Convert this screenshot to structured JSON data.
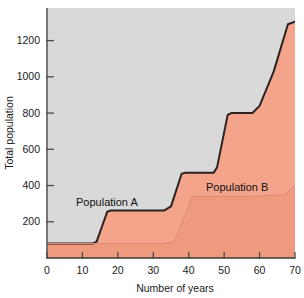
{
  "chart_data": {
    "type": "area",
    "title": "",
    "subtitle": "",
    "xlabel": "Number of years",
    "ylabel": "Total population",
    "xlim": [
      0,
      70
    ],
    "ylim": [
      0,
      1380
    ],
    "grid": false,
    "legend_position": "inline-annotations",
    "xticks": [
      0,
      10,
      20,
      30,
      40,
      50,
      60,
      70
    ],
    "xtick_labels": [
      "0",
      "10",
      "20",
      "30",
      "40",
      "50",
      "60",
      "70"
    ],
    "yticks": [
      200,
      400,
      600,
      800,
      1000,
      1200
    ],
    "ytick_labels": [
      "200",
      "400",
      "600",
      "800",
      "1000",
      "1200"
    ],
    "annotations": [
      {
        "text": "Population A",
        "x": 18,
        "y": 370
      },
      {
        "text": "Population B",
        "x": 48,
        "y": 460
      }
    ],
    "colors": {
      "plot_background": "#d9d9d9",
      "population_a_fill": "#f4a48a",
      "population_b_fill": "#ef9a7e",
      "total_outline": "#2b2320",
      "axis": "#5a5a5a",
      "text": "#1a1a1a"
    },
    "series": [
      {
        "name": "Population B",
        "description": "Lower stacked band, stepped growth",
        "x": [
          0,
          14,
          17,
          33,
          36,
          41,
          58,
          62,
          67,
          70
        ],
        "values": [
          80,
          80,
          80,
          80,
          90,
          340,
          340,
          345,
          350,
          400
        ]
      },
      {
        "name": "Total (Population A + Population B)",
        "description": "Upper boundary curve, stepped S-shaped growth",
        "x": [
          0,
          13,
          14,
          17,
          18,
          33,
          35,
          38,
          39,
          47,
          48,
          51,
          52,
          58,
          60,
          64,
          68,
          70
        ],
        "values": [
          80,
          80,
          90,
          255,
          262,
          262,
          285,
          465,
          470,
          470,
          500,
          790,
          800,
          800,
          840,
          1030,
          1290,
          1305
        ]
      }
    ]
  }
}
